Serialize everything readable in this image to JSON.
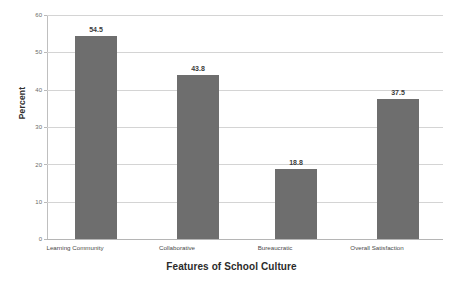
{
  "chart_data": {
    "type": "bar",
    "title": "",
    "xlabel": "Features of School Culture",
    "ylabel": "Percent",
    "categories": [
      "Learning Community",
      "Collaborative",
      "Bureaucratic",
      "Overall Satisfaction"
    ],
    "values": [
      54.5,
      43.8,
      18.8,
      37.5
    ],
    "value_labels": [
      "54.5",
      "43.8",
      "18.8",
      "37.5"
    ],
    "ylim": [
      0,
      60
    ],
    "yticks": [
      0,
      10,
      20,
      30,
      40,
      50,
      60
    ],
    "ytick_labels": [
      "0",
      "10",
      "20",
      "30",
      "40",
      "50",
      "60"
    ],
    "grid": "horizontal",
    "legend": "none",
    "bar_color": "#6e6e6e",
    "background_color": "#ffffff",
    "gridline_color": "#d4d4d4",
    "axis_color": "#b9b9b9"
  }
}
